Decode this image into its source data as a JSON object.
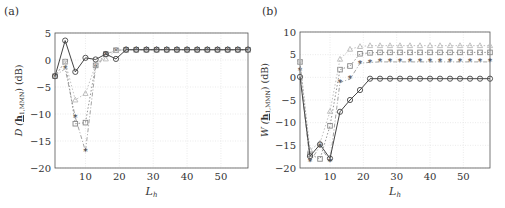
{
  "chart_data": [
    {
      "panel_label": "(a)",
      "type": "line",
      "title": "",
      "xlabel": "L_h",
      "ylabel": "D(h_{1,MMN}) (dB)",
      "xlim": [
        1,
        58
      ],
      "ylim": [
        -20,
        5
      ],
      "xticks": [
        10,
        20,
        30,
        40,
        50
      ],
      "yticks": [
        5,
        0,
        -5,
        -10,
        -15,
        -20
      ],
      "grid": true,
      "x": [
        1,
        4,
        7,
        10,
        13,
        16,
        19,
        22,
        25,
        28,
        31,
        34,
        37,
        40,
        43,
        46,
        49,
        52,
        55,
        58
      ],
      "series": [
        {
          "name": "circle",
          "marker": "o",
          "style": "solid",
          "color": "#444444",
          "values": [
            -3,
            3.6,
            -2.2,
            0.4,
            0.1,
            1.1,
            0.2,
            1.9,
            1.9,
            1.9,
            1.9,
            1.9,
            1.9,
            1.9,
            1.9,
            1.9,
            1.9,
            1.9,
            1.9,
            1.9
          ]
        },
        {
          "name": "triangle",
          "marker": "^",
          "style": "dotted",
          "color": "#bbbbbb",
          "values": [
            -3,
            -0.3,
            -7.4,
            -6.2,
            -0.9,
            0.2,
            1.8,
            1.9,
            1.9,
            1.9,
            1.9,
            1.9,
            1.9,
            1.9,
            1.9,
            1.9,
            1.9,
            1.9,
            1.9,
            1.9
          ]
        },
        {
          "name": "square",
          "marker": "s",
          "style": "dotted",
          "color": "#888888",
          "values": [
            -3,
            -0.3,
            -11.8,
            -11.6,
            -1.0,
            1.1,
            1.8,
            1.9,
            1.9,
            1.9,
            1.9,
            1.9,
            1.9,
            1.9,
            1.9,
            1.9,
            1.9,
            1.9,
            1.9,
            1.9
          ]
        },
        {
          "name": "star",
          "marker": "*",
          "style": "dashdot",
          "color": "#999999",
          "values": [
            -3,
            -1.6,
            -10.6,
            -16.9,
            -1.4,
            1.0,
            1.8,
            1.9,
            1.9,
            1.9,
            1.9,
            1.9,
            1.9,
            1.9,
            1.9,
            1.9,
            1.9,
            1.9,
            1.9,
            1.9
          ]
        }
      ]
    },
    {
      "panel_label": "(b)",
      "type": "line",
      "title": "",
      "xlabel": "L_h",
      "ylabel": "W(h_{1,MMN}) (dB)",
      "xlim": [
        1,
        58
      ],
      "ylim": [
        -20,
        10
      ],
      "xticks": [
        10,
        20,
        30,
        40,
        50
      ],
      "yticks": [
        10,
        5,
        0,
        -5,
        -10,
        -15,
        -20
      ],
      "grid": true,
      "x": [
        1,
        4,
        7,
        10,
        13,
        16,
        19,
        22,
        25,
        28,
        31,
        34,
        37,
        40,
        43,
        46,
        49,
        52,
        55,
        58
      ],
      "series": [
        {
          "name": "circle",
          "marker": "o",
          "style": "solid",
          "color": "#444444",
          "values": [
            0.1,
            -17.4,
            -14.8,
            -17.9,
            -7.6,
            -5.0,
            -2.8,
            -0.3,
            -0.3,
            -0.3,
            -0.3,
            -0.3,
            -0.3,
            -0.3,
            -0.3,
            -0.3,
            -0.3,
            -0.3,
            -0.3,
            -0.3
          ]
        },
        {
          "name": "triangle",
          "marker": "^",
          "style": "dotted",
          "color": "#bbbbbb",
          "values": [
            3.6,
            -16.0,
            -14.5,
            -7.5,
            4.0,
            6.2,
            6.8,
            7.0,
            7.0,
            7.0,
            7.0,
            7.0,
            7.0,
            7.0,
            7.0,
            7.0,
            7.0,
            7.0,
            7.0,
            7.0
          ]
        },
        {
          "name": "square",
          "marker": "s",
          "style": "dotted",
          "color": "#888888",
          "values": [
            3.4,
            -17.0,
            -18.0,
            -10.7,
            1.7,
            2.5,
            5.2,
            5.4,
            5.5,
            5.5,
            5.5,
            5.5,
            5.5,
            5.5,
            5.5,
            5.5,
            5.5,
            5.5,
            5.5,
            5.5
          ]
        },
        {
          "name": "star",
          "marker": "*",
          "style": "dashdot",
          "color": "#999999",
          "values": [
            1.5,
            -18.6,
            -15.2,
            -18.5,
            -1.1,
            -0.4,
            3.1,
            3.3,
            3.4,
            3.4,
            3.4,
            3.4,
            3.4,
            3.4,
            3.4,
            3.4,
            3.4,
            3.4,
            3.4,
            3.4
          ]
        }
      ]
    }
  ]
}
